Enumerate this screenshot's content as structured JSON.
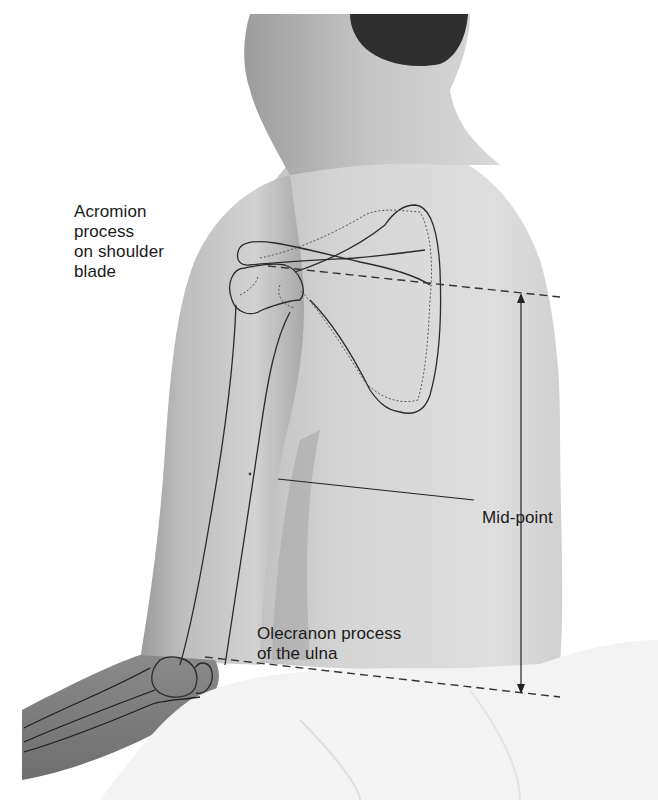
{
  "figure": {
    "kind": "anatomical illustration",
    "labels": {
      "acromion": [
        "Acromion",
        "process",
        "on shoulder",
        "blade"
      ],
      "midpoint": "Mid-point",
      "olecranon": [
        "Olecranon process",
        "of the ulna"
      ]
    },
    "annotations": {
      "upper_reference_line": "dashed line from acromion process across back",
      "lower_reference_line": "dashed line from olecranon process across back",
      "measurement_arrow": "double-headed vertical arrow between the two dashed lines",
      "midpoint_leader": "solid leader line from mid-upper-arm to Mid-point label"
    },
    "colors": {
      "background": "#ffffff",
      "skin_light": "#dcdcdc",
      "skin_mid": "#c4c4c4",
      "skin_shadow": "#8e8e8e",
      "hair": "#2e2e2e",
      "cloth": "#f2f2f2",
      "outline": "#2a2a2a"
    }
  }
}
